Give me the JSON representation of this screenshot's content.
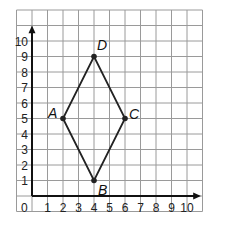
{
  "diagram": {
    "type": "coordinate-plane",
    "grid": {
      "x_min": -1,
      "x_max": 11,
      "y_min": -1,
      "y_max": 12,
      "step": 1,
      "line_color": "#9a9a9a"
    },
    "axes": {
      "color": "#111111",
      "origin_label": "0",
      "x_ticks": [
        "1",
        "2",
        "3",
        "4",
        "5",
        "6",
        "7",
        "8",
        "9",
        "10"
      ],
      "y_ticks": [
        "1",
        "2",
        "3",
        "4",
        "5",
        "6",
        "7",
        "8",
        "9",
        "10"
      ]
    },
    "shape": {
      "name": "rhombus ABCD",
      "color": "#222222",
      "vertices": [
        {
          "label": "A",
          "x": 2,
          "y": 5
        },
        {
          "label": "B",
          "x": 4,
          "y": 1
        },
        {
          "label": "C",
          "x": 6,
          "y": 5
        },
        {
          "label": "D",
          "x": 4,
          "y": 9
        }
      ]
    }
  }
}
